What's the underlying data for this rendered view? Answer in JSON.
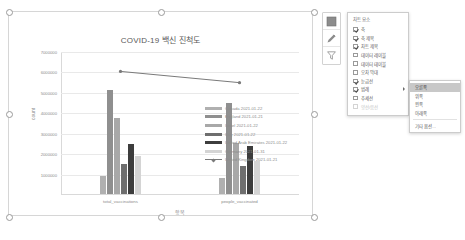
{
  "chart_data": {
    "type": "bar",
    "title": "COVID-19 백신 진척도",
    "xlabel": "항목",
    "ylabel": "count",
    "categories": [
      "total_vaccinations",
      "people_vaccinated"
    ],
    "ylim": [
      0,
      7000000
    ],
    "yticks": [
      1000000,
      2000000,
      3000000,
      4000000,
      5000000,
      6000000,
      7000000
    ],
    "ytick_labels": [
      "1000000",
      "2000000",
      "3000000",
      "4000000",
      "5000000",
      "6000000",
      "7000000"
    ],
    "grid": true,
    "legend_position": "right",
    "series": [
      {
        "name": "Canada 2021-01-22",
        "color": "#b0b0b0",
        "values": [
          900000,
          760000
        ]
      },
      {
        "name": "England 2021-01-21",
        "color": "#8f8f8f",
        "values": [
          5100000,
          4450000
        ]
      },
      {
        "name": "Israel 2021-01-22",
        "color": "#a8a8a8",
        "values": [
          3700000,
          2500000
        ]
      },
      {
        "name": "Italy 2021-01-22",
        "color": "#6e6e6e",
        "values": [
          1450000,
          1380000
        ]
      },
      {
        "name": "United Arab Emirates 2021-01-22",
        "color": "#3d3d3d",
        "values": [
          2450000,
          2350000
        ]
      },
      {
        "name": "Germany 2021-01-31",
        "color": "#d4d4d4",
        "values": [
          1850000,
          1600000
        ]
      }
    ],
    "trendline": {
      "name": "United Kingdom 2021-01-21",
      "values": [
        6050000,
        5500000
      ]
    }
  },
  "chart_elements_panel": {
    "title": "차트 요소",
    "items": [
      {
        "label": "축",
        "checked": true,
        "disabled": false,
        "arrow": false
      },
      {
        "label": "축 제목",
        "checked": true,
        "disabled": false,
        "arrow": false
      },
      {
        "label": "차트 제목",
        "checked": true,
        "disabled": false,
        "arrow": false
      },
      {
        "label": "데이터 레이블",
        "checked": false,
        "disabled": false,
        "arrow": false
      },
      {
        "label": "데이터 테이블",
        "checked": false,
        "disabled": false,
        "arrow": false
      },
      {
        "label": "오차 막대",
        "checked": false,
        "disabled": false,
        "arrow": false
      },
      {
        "label": "눈금선",
        "checked": true,
        "disabled": false,
        "arrow": false
      },
      {
        "label": "범례",
        "checked": true,
        "disabled": false,
        "arrow": true
      },
      {
        "label": "추세선",
        "checked": false,
        "disabled": false,
        "arrow": false
      },
      {
        "label": "양선/음선",
        "checked": false,
        "disabled": true,
        "arrow": false
      }
    ]
  },
  "legend_submenu": {
    "items": [
      "오른쪽",
      "위쪽",
      "왼쪽",
      "아래쪽"
    ],
    "more_options": "기타 옵션...",
    "selected": "오른쪽"
  },
  "side_tools": [
    {
      "name": "chart-elements-tool",
      "glyph": "▦"
    },
    {
      "name": "chart-styles-tool",
      "glyph": "✎"
    },
    {
      "name": "chart-filters-tool",
      "glyph": "▽"
    }
  ]
}
